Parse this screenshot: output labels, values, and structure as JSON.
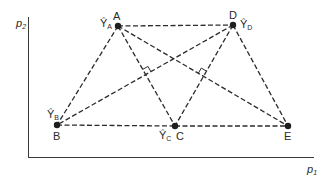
{
  "diagram": {
    "colors": {
      "line": "#2b2b2b",
      "axis": "#3a3a3a",
      "point": "#1e1e1e",
      "background": "#ffffff"
    },
    "axes": {
      "x_label": "p",
      "x_label_sub": "1",
      "y_label": "p",
      "y_label_sub": "2"
    },
    "points": [
      {
        "id": "A",
        "label": "A",
        "x": 118,
        "y": 26,
        "estimate_label": "Ŷ",
        "estimate_sub": "A"
      },
      {
        "id": "D",
        "label": "D",
        "x": 233,
        "y": 25,
        "estimate_label": "Ŷ",
        "estimate_sub": "D"
      },
      {
        "id": "B",
        "label": "B",
        "x": 57,
        "y": 125,
        "estimate_label": "Ŷ",
        "estimate_sub": "B"
      },
      {
        "id": "C",
        "label": "C",
        "x": 175,
        "y": 126,
        "estimate_label": "Ŷ",
        "estimate_sub": "C"
      },
      {
        "id": "E",
        "label": "E",
        "x": 288,
        "y": 126,
        "estimate_label": "",
        "estimate_sub": ""
      }
    ],
    "edges": [
      [
        "A",
        "D"
      ],
      [
        "B",
        "C"
      ],
      [
        "C",
        "E"
      ],
      [
        "A",
        "B"
      ],
      [
        "A",
        "C"
      ],
      [
        "A",
        "E"
      ],
      [
        "D",
        "B"
      ],
      [
        "D",
        "C"
      ],
      [
        "D",
        "E"
      ]
    ],
    "right_angles": [
      {
        "between": [
          "A-C",
          "B-D"
        ],
        "x": 145.7,
        "y": 74.6
      },
      {
        "between": [
          "D-C",
          "A-E"
        ],
        "x": 203.5,
        "y": 76.3
      }
    ]
  }
}
